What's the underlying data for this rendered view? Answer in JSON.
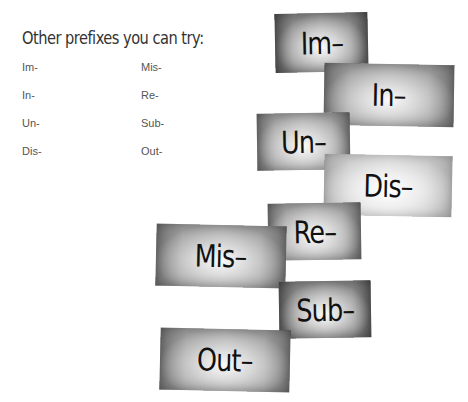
{
  "heading": "Other prefixes you can try:",
  "prefix_list": {
    "column1": [
      "Im-",
      "In-",
      "Un-",
      "Dis-"
    ],
    "column2": [
      "Mis-",
      "Re-",
      "Sub-",
      "Out-"
    ]
  },
  "cards": [
    {
      "label": "Im–",
      "tone": "dark"
    },
    {
      "label": "In–",
      "tone": "mid"
    },
    {
      "label": "Un–",
      "tone": "mid"
    },
    {
      "label": "Dis–",
      "tone": "light"
    },
    {
      "label": "Re–",
      "tone": "mid"
    },
    {
      "label": "Mis–",
      "tone": "mid"
    },
    {
      "label": "Sub–",
      "tone": "dark"
    },
    {
      "label": "Out–",
      "tone": "mid"
    }
  ]
}
